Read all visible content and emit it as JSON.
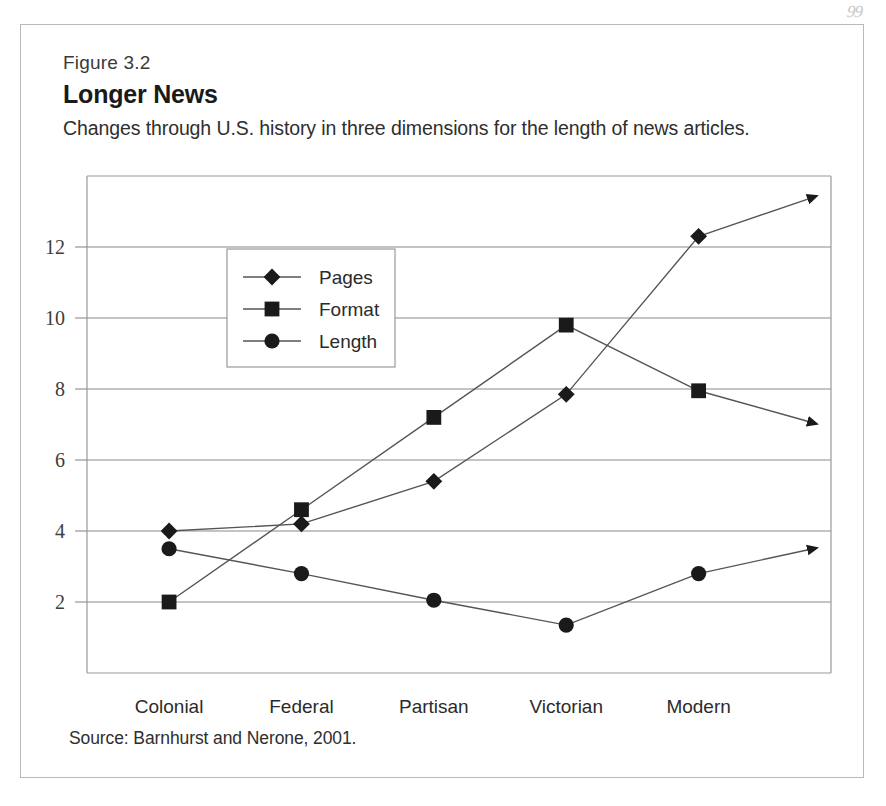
{
  "page": {
    "page_number_artifact": "99"
  },
  "figure": {
    "number_label": "Figure 3.2",
    "title": "Longer News",
    "subtitle": "Changes through U.S. history in three dimensions for the length of news articles.",
    "source": "Source: Barnhurst and Nerone, 2001."
  },
  "colors": {
    "ink": "#231f20",
    "marker": "#1a1a1a",
    "line": "#555555",
    "gridline": "#8a8a8a",
    "frame": "#999999",
    "card_border": "#b9b9b9",
    "background": "#ffffff"
  },
  "chart_data": {
    "type": "line",
    "title": "Longer News",
    "subtitle": "Changes through U.S. history in three dimensions for the length of news articles.",
    "xlabel": "",
    "ylabel": "",
    "categories": [
      "Colonial",
      "Federal",
      "Partisan",
      "Victorian",
      "Modern"
    ],
    "x_tick_labels": [
      "Colonial",
      "Federal",
      "Partisan",
      "Victorian",
      "Modern"
    ],
    "y_tick_labels": [
      "2",
      "4",
      "6",
      "8",
      "10",
      "12"
    ],
    "y_ticks": [
      2,
      4,
      6,
      8,
      10,
      12
    ],
    "ylim": [
      0,
      14
    ],
    "grid": true,
    "grid_axis": "y",
    "legend_position": "upper-left-inside",
    "series": [
      {
        "name": "Pages",
        "marker": "diamond",
        "values": [
          4.0,
          4.2,
          5.4,
          7.85,
          12.3
        ],
        "arrow_end": true,
        "arrow_end_value": 13.4
      },
      {
        "name": "Format",
        "marker": "square",
        "values": [
          2.0,
          4.6,
          7.2,
          9.8,
          7.95
        ],
        "arrow_end": true,
        "arrow_end_value": 7.05
      },
      {
        "name": "Length",
        "marker": "circle",
        "values": [
          3.5,
          2.8,
          2.05,
          1.35,
          2.8
        ],
        "arrow_end": true,
        "arrow_end_value": 3.5
      }
    ],
    "legend": [
      "Pages",
      "Format",
      "Length"
    ],
    "annotations": []
  }
}
